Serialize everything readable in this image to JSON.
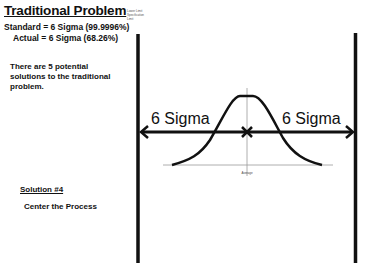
{
  "slide": {
    "title": "Traditional Problem",
    "standard_line": "Standard = 6 Sigma (99.9996%)",
    "actual_line": "Actual = 6 Sigma (68.26%)",
    "intro_text": "There are 5 potential solutions to the traditional problem.",
    "solution_heading": "Solution #4",
    "solution_text": "Center the Process"
  },
  "legend": {
    "items": [
      "Lower Limit",
      "Specification",
      "Limit"
    ]
  },
  "diagram": {
    "left_label": "6 Sigma",
    "right_label": "6 Sigma",
    "center_axis_label": "Average",
    "line_color": "#111111",
    "axis_color": "#999999"
  }
}
